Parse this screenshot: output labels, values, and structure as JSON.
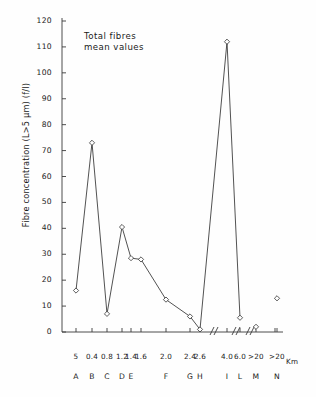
{
  "figure": {
    "annotation_line1": "Total fibres",
    "annotation_line2": "mean values",
    "ylabel": "Fibre concentration  (L>5 µm) (f/l)",
    "xunit_label": "Km"
  },
  "chart_data": {
    "type": "line",
    "xlabel": "Km",
    "ylabel": "Fibre concentration (L>5 µm) (f/l)",
    "ylim": [
      0,
      120
    ],
    "ytick_labels": [
      "0",
      "10",
      "20",
      "30",
      "40",
      "50",
      "60",
      "70",
      "80",
      "90",
      "100",
      "110",
      "120"
    ],
    "ytick_values": [
      0,
      10,
      20,
      30,
      40,
      50,
      60,
      70,
      80,
      90,
      100,
      110,
      120
    ],
    "grid": false,
    "legend": "none",
    "marker": "open-diamond",
    "axis_breaks": 3,
    "distance_labels": [
      "5",
      "0.4",
      "0.8",
      "1.2",
      "1.4",
      "1.6",
      "2.0",
      "2.4",
      "2.6",
      "4.0",
      "6.0",
      ">20",
      ">20"
    ],
    "station_labels": [
      "A",
      "B",
      "C",
      "D",
      "E",
      "",
      "F",
      "G",
      "H",
      "I",
      "L",
      "M",
      "N"
    ],
    "categories": [
      "A",
      "B",
      "C",
      "D",
      "E",
      "E2",
      "F",
      "G",
      "H",
      "I",
      "L",
      "M",
      "N"
    ],
    "values": [
      16,
      73,
      7,
      40.5,
      28.5,
      28,
      12.5,
      6,
      1,
      112,
      5.5,
      2,
      13
    ],
    "connected": [
      true,
      true,
      true,
      true,
      true,
      true,
      true,
      true,
      true,
      true,
      true,
      false,
      false
    ],
    "points": [
      {
        "station": "A",
        "distance": "5",
        "value": 16
      },
      {
        "station": "B",
        "distance": "0.4",
        "value": 73
      },
      {
        "station": "C",
        "distance": "0.8",
        "value": 7
      },
      {
        "station": "D",
        "distance": "1.2",
        "value": 40.5
      },
      {
        "station": "E",
        "distance": "1.4",
        "value": 28.5
      },
      {
        "station": "",
        "distance": "1.6",
        "value": 28
      },
      {
        "station": "F",
        "distance": "2.0",
        "value": 12.5
      },
      {
        "station": "G",
        "distance": "2.4",
        "value": 6
      },
      {
        "station": "H",
        "distance": "2.6",
        "value": 1
      },
      {
        "station": "I",
        "distance": "4.0",
        "value": 112
      },
      {
        "station": "L",
        "distance": "6.0",
        "value": 5.5
      },
      {
        "station": "M",
        "distance": ">20",
        "value": 2
      },
      {
        "station": "N",
        "distance": ">20",
        "value": 13
      }
    ]
  }
}
